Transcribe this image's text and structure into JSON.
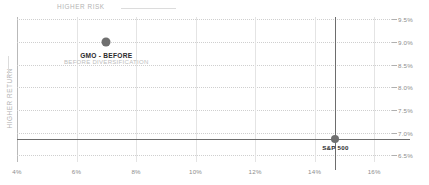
{
  "chart_data": {
    "type": "scatter",
    "title": "",
    "xlabel": "HIGHER RISK",
    "ylabel": "HIGHER RETURN",
    "xlim": [
      4,
      16.6
    ],
    "ylim": [
      6.35,
      9.55
    ],
    "xticks": [
      "4%",
      "6%",
      "8%",
      "10%",
      "12%",
      "14%",
      "16%"
    ],
    "xtick_values": [
      4,
      6,
      8,
      10,
      12,
      14,
      16
    ],
    "yticks": [
      "9.5%",
      "9.0%",
      "8.5%",
      "8.0%",
      "7.5%",
      "7.0%",
      "6.5%"
    ],
    "ytick_values": [
      9.5,
      9.0,
      8.5,
      8.0,
      7.5,
      7.0,
      6.5
    ],
    "grid": true,
    "legend_position": "none",
    "points": [
      {
        "name": "GMO - BEFORE",
        "sublabel": "BEFORE DIVERSIFICATION",
        "x": 7.0,
        "y": 9.0,
        "color": "#6f6f6f"
      },
      {
        "name": "S&P 500",
        "sublabel": "",
        "x": 14.7,
        "y": 6.85,
        "color": "#707070"
      }
    ],
    "reference_lines": {
      "horizontal_value": 6.85,
      "vertical_value": 14.7,
      "color": "#6d6d6d"
    },
    "axis_caption_color": "#b3b3b3",
    "tick_label_color": "#8d8d8d",
    "grid_color": "#cfcfcf"
  }
}
